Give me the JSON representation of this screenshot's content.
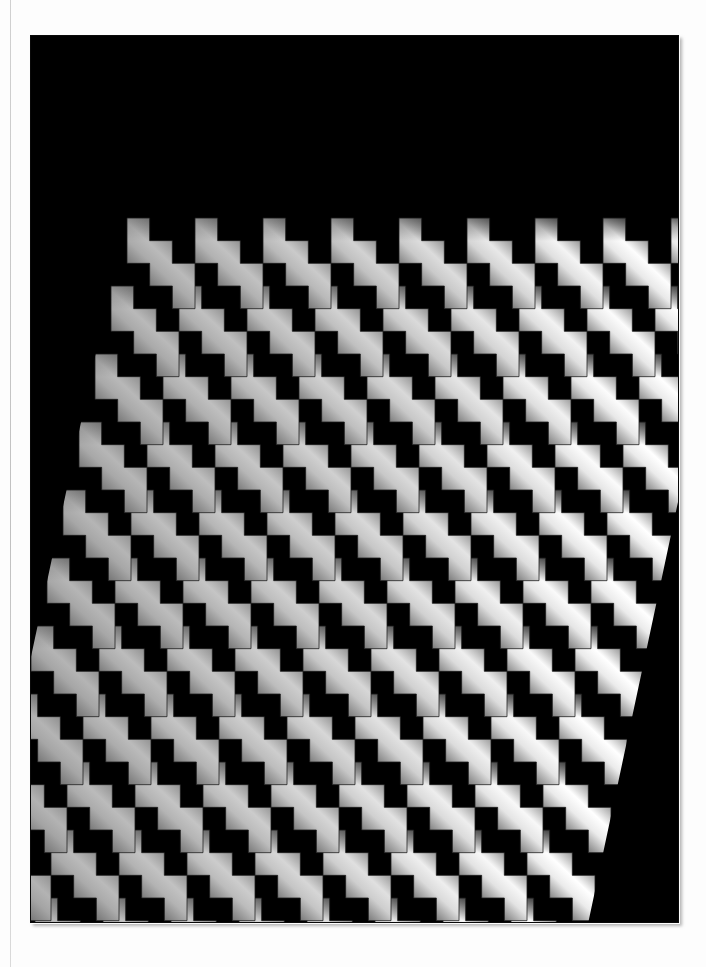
{
  "page": {
    "background_color": "#fdfdfd",
    "fold_line_color": "#c9c9c9"
  },
  "plate": {
    "background_color": "#000000",
    "x": 31,
    "y": 36,
    "width": 647,
    "height": 886,
    "caption": ""
  },
  "artwork": {
    "name": "zigzag-staircase-relief",
    "description": "Parallelogram array of interlocking staircase tiles with diagonal gradient shading on a black field",
    "field_color": "#000000",
    "highlight_color": "#ffffff",
    "shadow_color": "#000000",
    "midtone_color": "#8a8a8a",
    "edge_line_color": "#1c1c1c",
    "columns": 9,
    "rows": 11,
    "tile_width": 68,
    "tile_height": 68,
    "step_count": 3,
    "row_shift_x": -16,
    "col_shift_y": 0,
    "gradient_angle_deg": 45,
    "contrast_min": 0.34,
    "contrast_max": 1.0,
    "origin_x": 96,
    "origin_y": 182
  },
  "chart_data": {
    "type": "heatmap",
    "title": "Op Art Zigzag Relief",
    "xlabel": "",
    "ylabel": "",
    "categories": [
      "c1",
      "c2",
      "c3",
      "c4",
      "c5",
      "c6",
      "c7",
      "c8",
      "c9"
    ],
    "series": [
      {
        "name": "row1",
        "values": [
          0.4,
          0.46,
          0.53,
          0.6,
          0.68,
          0.78,
          0.88,
          0.96,
          1.0
        ]
      },
      {
        "name": "row2",
        "values": [
          0.39,
          0.45,
          0.52,
          0.59,
          0.67,
          0.77,
          0.87,
          0.95,
          1.0
        ]
      },
      {
        "name": "row3",
        "values": [
          0.38,
          0.44,
          0.51,
          0.58,
          0.66,
          0.76,
          0.86,
          0.95,
          1.0
        ]
      },
      {
        "name": "row4",
        "values": [
          0.37,
          0.43,
          0.5,
          0.58,
          0.66,
          0.75,
          0.86,
          0.94,
          1.0
        ]
      },
      {
        "name": "row5",
        "values": [
          0.36,
          0.43,
          0.5,
          0.57,
          0.65,
          0.75,
          0.85,
          0.94,
          1.0
        ]
      },
      {
        "name": "row6",
        "values": [
          0.36,
          0.42,
          0.49,
          0.57,
          0.65,
          0.74,
          0.85,
          0.93,
          1.0
        ]
      },
      {
        "name": "row7",
        "values": [
          0.35,
          0.42,
          0.49,
          0.56,
          0.64,
          0.74,
          0.84,
          0.93,
          1.0
        ]
      },
      {
        "name": "row8",
        "values": [
          0.35,
          0.41,
          0.48,
          0.56,
          0.64,
          0.73,
          0.84,
          0.92,
          1.0
        ]
      },
      {
        "name": "row9",
        "values": [
          0.34,
          0.41,
          0.48,
          0.55,
          0.63,
          0.73,
          0.83,
          0.92,
          1.0
        ]
      },
      {
        "name": "row10",
        "values": [
          0.34,
          0.4,
          0.47,
          0.55,
          0.63,
          0.72,
          0.83,
          0.91,
          1.0
        ]
      },
      {
        "name": "row11",
        "values": [
          0.34,
          0.4,
          0.47,
          0.54,
          0.62,
          0.72,
          0.82,
          0.91,
          1.0
        ]
      }
    ],
    "legend_position": "none",
    "grid": false
  }
}
